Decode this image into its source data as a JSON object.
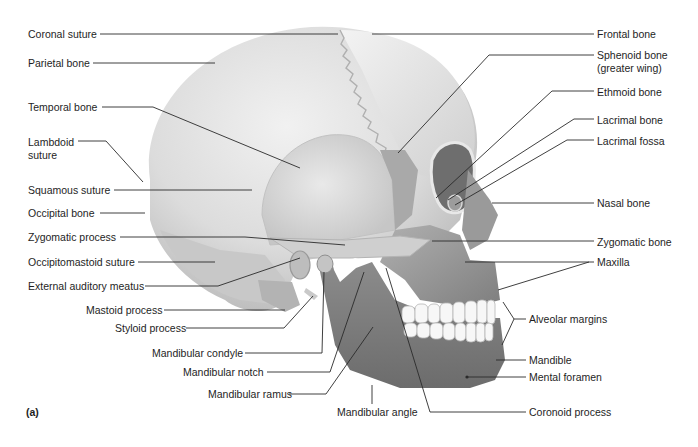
{
  "figure": {
    "panel_label": "(a)"
  },
  "labels_left": [
    {
      "id": "coronal-suture",
      "text": "Coronal suture",
      "x": 28,
      "y": 28
    },
    {
      "id": "parietal-bone",
      "text": "Parietal bone",
      "x": 28,
      "y": 57
    },
    {
      "id": "temporal-bone",
      "text": "Temporal bone",
      "x": 28,
      "y": 101
    },
    {
      "id": "lambdoid-suture-1",
      "text": "Lambdoid",
      "x": 28,
      "y": 136
    },
    {
      "id": "lambdoid-suture-2",
      "text": "suture",
      "x": 28,
      "y": 149
    },
    {
      "id": "squamous-suture",
      "text": "Squamous suture",
      "x": 28,
      "y": 184
    },
    {
      "id": "occipital-bone",
      "text": "Occipital bone",
      "x": 28,
      "y": 207
    },
    {
      "id": "zygomatic-process",
      "text": "Zygomatic process",
      "x": 28,
      "y": 231
    },
    {
      "id": "occipitomastoid-suture",
      "text": "Occipitomastoid suture",
      "x": 28,
      "y": 256
    },
    {
      "id": "external-auditory-meatus",
      "text": "External auditory meatus",
      "x": 28,
      "y": 280
    },
    {
      "id": "mastoid-process",
      "text": "Mastoid process",
      "x": 86,
      "y": 304
    },
    {
      "id": "styloid-process",
      "text": "Styloid process",
      "x": 115,
      "y": 322
    },
    {
      "id": "mandibular-condyle",
      "text": "Mandibular condyle",
      "x": 152,
      "y": 347
    },
    {
      "id": "mandibular-notch",
      "text": "Mandibular notch",
      "x": 183,
      "y": 366
    },
    {
      "id": "mandibular-ramus",
      "text": "Mandibular ramus",
      "x": 208,
      "y": 388
    }
  ],
  "labels_right": [
    {
      "id": "frontal-bone",
      "text": "Frontal bone",
      "x": 597,
      "y": 28
    },
    {
      "id": "sphenoid-bone-1",
      "text": "Sphenoid bone",
      "x": 597,
      "y": 49
    },
    {
      "id": "sphenoid-bone-2",
      "text": "(greater wing)",
      "x": 597,
      "y": 62
    },
    {
      "id": "ethmoid-bone",
      "text": "Ethmoid bone",
      "x": 597,
      "y": 86
    },
    {
      "id": "lacrimal-bone",
      "text": "Lacrimal bone",
      "x": 597,
      "y": 114
    },
    {
      "id": "lacrimal-fossa",
      "text": "Lacrimal fossa",
      "x": 597,
      "y": 135
    },
    {
      "id": "nasal-bone",
      "text": "Nasal bone",
      "x": 597,
      "y": 197
    },
    {
      "id": "zygomatic-bone",
      "text": "Zygomatic bone",
      "x": 597,
      "y": 236
    },
    {
      "id": "maxilla",
      "text": "Maxilla",
      "x": 597,
      "y": 256
    },
    {
      "id": "alveolar-margins",
      "text": "Alveolar margins",
      "x": 529,
      "y": 313
    },
    {
      "id": "mandible",
      "text": "Mandible",
      "x": 529,
      "y": 354
    },
    {
      "id": "mental-foramen",
      "text": "Mental foramen",
      "x": 529,
      "y": 371
    },
    {
      "id": "coronoid-process",
      "text": "Coronoid process",
      "x": 529,
      "y": 406
    }
  ],
  "labels_bottom": [
    {
      "id": "mandibular-angle",
      "text": "Mandibular angle",
      "x": 337,
      "y": 406
    }
  ],
  "colors": {
    "background": "#ffffff",
    "text": "#1e1e1e",
    "leader_line": "#2a2a2a",
    "cranium_light": "#ececec",
    "cranium_mid": "#d6d6d6",
    "cranium_shadow": "#b8b8b8",
    "face_dark": "#8e8e8e",
    "mandible": "#8a8a8a",
    "teeth": "#f7f7f7"
  }
}
